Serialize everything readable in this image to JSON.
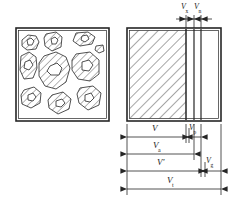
{
  "figure": {
    "stroke_color": "#262626",
    "background_color": "#ffffff",
    "hatch_color": "#3a3a3a"
  },
  "panels": {
    "left": {
      "name": "aggregate-particle-cross-section",
      "description": "Irregular hatched aggregate particles with internal voids",
      "x": 16,
      "y": 28,
      "width": 93,
      "height": 93
    },
    "right": {
      "name": "equivalent-volume-block",
      "description": "Equivalent rectangular block split into volume bands",
      "x": 127,
      "y": 28,
      "width": 94,
      "height": 93,
      "dividers": [
        186,
        194,
        201
      ]
    }
  },
  "top_labels": [
    {
      "id": "vx",
      "base": "V",
      "sub": "x",
      "x": 183,
      "y": 4
    },
    {
      "id": "vn",
      "base": "V",
      "sub": "n",
      "x": 196,
      "y": 4
    }
  ],
  "top_dimensions": [
    {
      "id": "dim-vx",
      "from": 186,
      "to": 194,
      "y": 19
    },
    {
      "id": "dim-vn",
      "from": 194,
      "to": 201,
      "y": 19
    }
  ],
  "bottom_dimensions": [
    {
      "id": "row-v-vp",
      "y": 137,
      "segments": [
        {
          "id": "seg-v",
          "base": "V",
          "sub": "",
          "from": 127,
          "to": 186,
          "label_x": 152,
          "label_y": 125
        },
        {
          "id": "seg-vp",
          "base": "V",
          "sub": "p",
          "from": 189,
          "to": 201,
          "label_x": 190,
          "label_y": 124
        }
      ]
    },
    {
      "id": "row-va",
      "y": 154,
      "segments": [
        {
          "id": "seg-va",
          "base": "V",
          "sub": "a",
          "from": 127,
          "to": 194,
          "label_x": 154,
          "label_y": 142
        }
      ]
    },
    {
      "id": "row-vprime-vg",
      "y": 171,
      "segments": [
        {
          "id": "seg-vprime",
          "base": "V",
          "prime": "'",
          "sub": "",
          "from": 127,
          "to": 201,
          "label_x": 158,
          "label_y": 159
        },
        {
          "id": "seg-vg",
          "base": "V",
          "sub": "g",
          "from": 205,
          "to": 221,
          "label_x": 207,
          "label_y": 158
        }
      ]
    },
    {
      "id": "row-vt",
      "y": 189,
      "segments": [
        {
          "id": "seg-vt",
          "base": "V",
          "sub": "t",
          "from": 127,
          "to": 221,
          "label_x": 168,
          "label_y": 177
        }
      ]
    }
  ],
  "labels": {
    "vx": "V",
    "vx_sub": "x",
    "vn": "V",
    "vn_sub": "n",
    "v": "V",
    "v_sub": "",
    "vp": "V",
    "vp_sub": "p",
    "va": "V",
    "va_sub": "a",
    "vprime": "V",
    "vprime_mark": "'",
    "vg": "V",
    "vg_sub": "g",
    "vt": "V",
    "vt_sub": "t"
  }
}
